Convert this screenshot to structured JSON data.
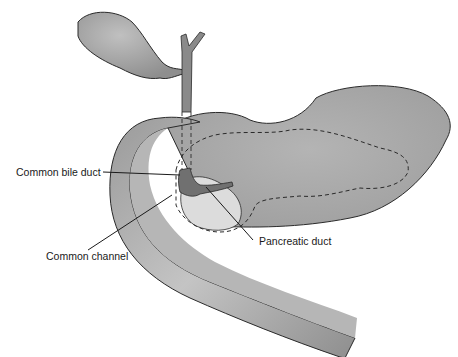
{
  "diagram": {
    "structures": [
      "gallbladder",
      "hepatic duct",
      "stomach",
      "pancreas (dashed outline)",
      "duodenum",
      "common bile duct",
      "pancreatic duct",
      "common channel"
    ],
    "labels": [
      {
        "id": "common-bile-duct",
        "text": "Common bile duct"
      },
      {
        "id": "common-channel",
        "text": "Common channel"
      },
      {
        "id": "pancreatic-duct",
        "text": "Pancreatic duct"
      }
    ],
    "colors": {
      "organ_fill": "#a8a8a8",
      "organ_dark": "#8a8a8a",
      "duct_fill": "#707070",
      "outline": "#2a2a2a",
      "light_region": "#dcdcdc"
    }
  }
}
